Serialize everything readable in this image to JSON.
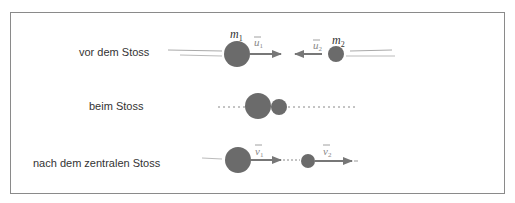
{
  "rows": [
    {
      "label": "vor dem Stoss"
    },
    {
      "label": "beim Stoss"
    },
    {
      "label": "nach dem zentralen Stoss"
    }
  ],
  "symbols": {
    "m1": "m",
    "m1_sub": "1",
    "m2": "m",
    "m2_sub": "2",
    "u1": "u",
    "u1_sub": "1",
    "u2": "u",
    "u2_sub": "2",
    "v1": "v",
    "v1_sub": "1",
    "v2": "v",
    "v2_sub": "2"
  },
  "colors": {
    "ball": "#6b6b6b",
    "arrow": "#777777",
    "frame": "#8a8a8a"
  }
}
